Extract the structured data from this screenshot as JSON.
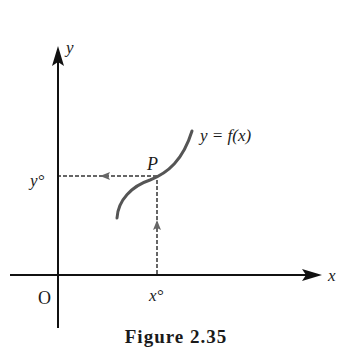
{
  "figure": {
    "caption": "Figure 2.35",
    "axes": {
      "x_label": "x",
      "y_label": "y",
      "origin_label": "O"
    },
    "curve": {
      "label": "y = f(x)",
      "color": "#555555"
    },
    "point": {
      "label": "P",
      "x_label": "x°",
      "y_label": "y°"
    },
    "colors": {
      "axis": "#111111",
      "dashed": "#666666",
      "curve": "#555555"
    }
  }
}
